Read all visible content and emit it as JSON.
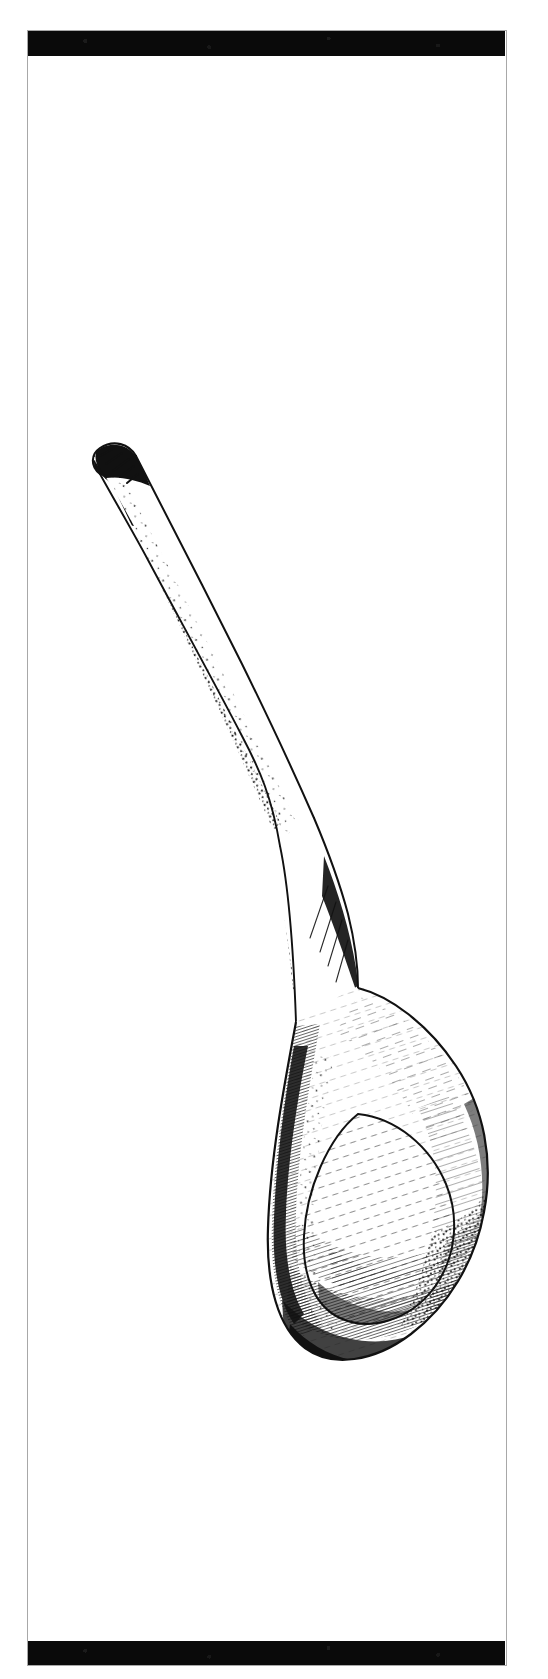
{
  "page": {
    "kind": "printed-plate",
    "background_color": "#ffffff",
    "ink_color": "#111111",
    "width": 548,
    "height": 1679
  },
  "frame": {
    "border_color": "#a8a8a8",
    "border_width_px": 1.4,
    "left": 27,
    "top": 30,
    "width": 480,
    "height": 1636
  },
  "bars": [
    {
      "name": "top-black-bar",
      "color": "#0a0a0a",
      "top": 31,
      "height": 25
    },
    {
      "name": "bottom-black-bar",
      "color": "#0a0a0a",
      "top": 1641,
      "height": 24
    }
  ],
  "illustration": {
    "subject": "wooden spoon",
    "technique": "pen-and-ink line drawing with stipple and cross-hatching",
    "orientation": "diagonal, handle upper-left, bowl lower-right",
    "parts": [
      {
        "name": "handle",
        "description": "long tapering shaft with rounded tip, stippled shadow along lower-left edge"
      },
      {
        "name": "neck",
        "description": "narrow junction flaring into the bowl"
      },
      {
        "name": "bowl",
        "description": "broad oval bowl with inner rim outline and dense diagonal hatching"
      },
      {
        "name": "bowl-rim",
        "description": "inner oval contour line inside the bowl"
      }
    ],
    "shading": {
      "stipple_side": "left",
      "hatch_direction": "diagonal, upper-right to lower-left",
      "darkest_regions": [
        "bowl left edge",
        "bowl lower band",
        "handle left edge"
      ]
    }
  }
}
